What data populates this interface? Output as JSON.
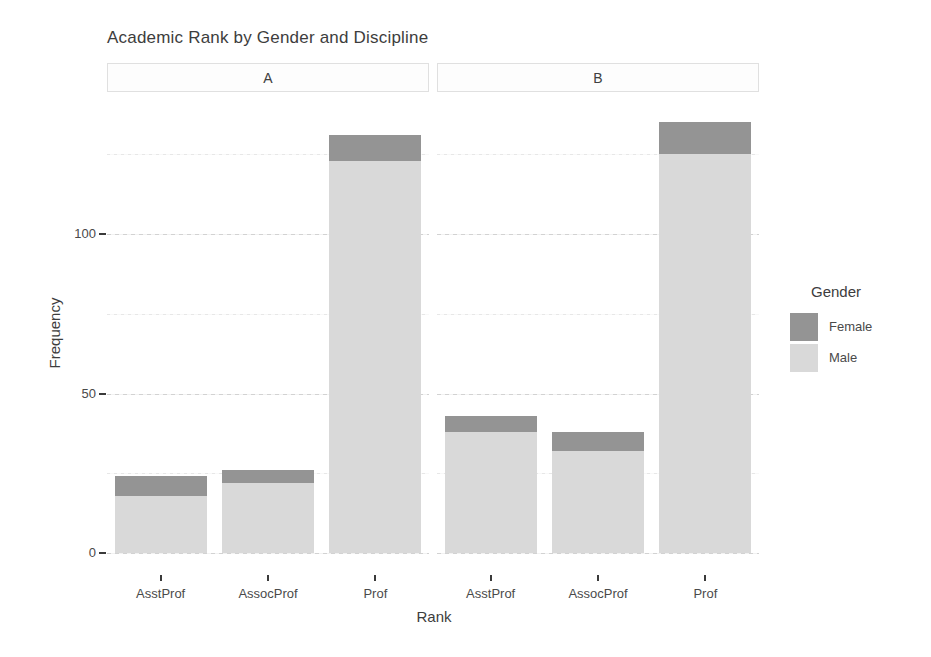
{
  "chart_data": {
    "type": "bar",
    "stacked": true,
    "title": "Academic Rank by Gender and Discipline",
    "xlabel": "Rank",
    "ylabel": "Frequency",
    "categories": [
      "AsstProf",
      "AssocProf",
      "Prof"
    ],
    "facets": [
      {
        "label": "A",
        "series": [
          {
            "name": "Male",
            "values": [
              18,
              22,
              123
            ]
          },
          {
            "name": "Female",
            "values": [
              6,
              4,
              8
            ]
          }
        ],
        "totals": [
          24,
          26,
          131
        ]
      },
      {
        "label": "B",
        "series": [
          {
            "name": "Male",
            "values": [
              38,
              32,
              125
            ]
          },
          {
            "name": "Female",
            "values": [
              5,
              6,
              10
            ]
          }
        ],
        "totals": [
          43,
          38,
          135
        ]
      }
    ],
    "y_axis": {
      "ticks": [
        0,
        50,
        100
      ],
      "minor_ticks": [
        25,
        75,
        125
      ],
      "range": [
        0,
        143
      ]
    },
    "legend": {
      "title": "Gender",
      "position": "right",
      "entries": [
        {
          "label": "Female",
          "color": "#949494"
        },
        {
          "label": "Male",
          "color": "#d9d9d9"
        }
      ]
    },
    "colors": {
      "Female": "#949494",
      "Male": "#d9d9d9"
    },
    "grid": true
  },
  "theme": {
    "background": "#ffffff",
    "text_color": "#3d3d3d",
    "tick_color": "#3a3a3a",
    "grid_major": "#d2d2d2",
    "grid_minor": "#e7e7e7",
    "strip_bg": "#fdfdfd",
    "strip_border": "#e0e0e0"
  }
}
